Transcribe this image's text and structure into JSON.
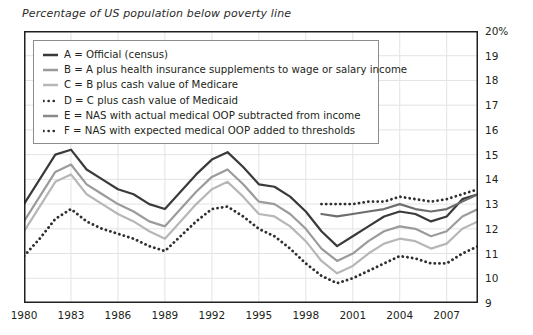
{
  "chart_data": {
    "type": "line",
    "title": "Percentage of US population below poverty line",
    "xlabel": "",
    "ylabel": "",
    "xlim": [
      1980,
      2009
    ],
    "ylim": [
      9,
      20
    ],
    "grid": true,
    "legend_position": "upper-left-inside",
    "y_ticks": [
      "20%",
      "19",
      "18",
      "17",
      "16",
      "15",
      "14",
      "13",
      "12",
      "11",
      "10",
      "9"
    ],
    "y_tick_values": [
      20,
      19,
      18,
      17,
      16,
      15,
      14,
      13,
      12,
      11,
      10,
      9
    ],
    "x_ticks": [
      "1980",
      "1983",
      "1986",
      "1989",
      "1992",
      "1995",
      "1998",
      "2001",
      "2004",
      "2007"
    ],
    "x_tick_values": [
      1980,
      1983,
      1986,
      1989,
      1992,
      1995,
      1998,
      2001,
      2004,
      2007
    ],
    "x": [
      1980,
      1981,
      1982,
      1983,
      1984,
      1985,
      1986,
      1987,
      1988,
      1989,
      1990,
      1991,
      1992,
      1993,
      1994,
      1995,
      1996,
      1997,
      1998,
      1999,
      2000,
      2001,
      2002,
      2003,
      2004,
      2005,
      2006,
      2007,
      2008,
      2009
    ],
    "series": [
      {
        "name": "A",
        "label": "A = Official (census)",
        "style": "solid",
        "color": "#3a3a3a",
        "width": 2.2,
        "values": [
          13.0,
          14.0,
          15.0,
          15.2,
          14.4,
          14.0,
          13.6,
          13.4,
          13.0,
          12.8,
          13.5,
          14.2,
          14.8,
          15.1,
          14.5,
          13.8,
          13.7,
          13.3,
          12.7,
          11.9,
          11.3,
          11.7,
          12.1,
          12.5,
          12.7,
          12.6,
          12.3,
          12.5,
          13.2,
          13.4
        ]
      },
      {
        "name": "B",
        "label": "B = A plus health insurance supplements to wage or salary income",
        "style": "solid",
        "color": "#9b9b9b",
        "width": 2.2,
        "values": [
          12.3,
          13.3,
          14.3,
          14.6,
          13.8,
          13.4,
          13.0,
          12.7,
          12.3,
          12.1,
          12.8,
          13.5,
          14.1,
          14.4,
          13.8,
          13.1,
          13.0,
          12.6,
          12.0,
          11.2,
          10.7,
          11.0,
          11.5,
          11.9,
          12.1,
          12.0,
          11.7,
          11.9,
          12.5,
          12.8
        ]
      },
      {
        "name": "C",
        "label": "C = B plus cash value of Medicare",
        "style": "solid",
        "color": "#b7b7b7",
        "width": 2.2,
        "values": [
          11.9,
          12.9,
          13.9,
          14.2,
          13.4,
          13.0,
          12.6,
          12.3,
          11.9,
          11.6,
          12.3,
          13.0,
          13.6,
          13.9,
          13.3,
          12.6,
          12.5,
          12.1,
          11.5,
          10.7,
          10.2,
          10.5,
          11.0,
          11.4,
          11.6,
          11.5,
          11.2,
          11.4,
          12.0,
          12.3
        ]
      },
      {
        "name": "D",
        "label": "D = C plus cash value of Medicaid",
        "style": "dotted",
        "color": "#2f2f2f",
        "width": 2.4,
        "values": [
          10.9,
          11.6,
          12.4,
          12.8,
          12.3,
          12.0,
          11.8,
          11.6,
          11.3,
          11.1,
          11.7,
          12.3,
          12.8,
          12.9,
          12.5,
          12.0,
          11.7,
          11.2,
          10.6,
          10.1,
          9.8,
          10.0,
          10.3,
          10.6,
          10.9,
          10.8,
          10.6,
          10.6,
          11.0,
          11.3
        ]
      },
      {
        "name": "E",
        "label": "E = NAS with actual medical OOP subtracted from income",
        "style": "solid",
        "color": "#6e6e6e",
        "width": 2.2,
        "values": [
          null,
          null,
          null,
          null,
          null,
          null,
          null,
          null,
          null,
          null,
          null,
          null,
          null,
          null,
          null,
          null,
          null,
          null,
          null,
          12.6,
          12.5,
          12.6,
          12.7,
          12.8,
          13.0,
          12.8,
          12.7,
          12.8,
          13.1,
          13.4
        ]
      },
      {
        "name": "F",
        "label": "F = NAS with expected medical OOP added to thresholds",
        "style": "dotted",
        "color": "#2f2f2f",
        "width": 2.4,
        "values": [
          null,
          null,
          null,
          null,
          null,
          null,
          null,
          null,
          null,
          null,
          null,
          null,
          null,
          null,
          null,
          null,
          null,
          null,
          null,
          13.0,
          13.0,
          13.0,
          13.1,
          13.1,
          13.3,
          13.2,
          13.1,
          13.2,
          13.4,
          13.6
        ]
      }
    ]
  },
  "legend": {
    "items": [
      {
        "label": "A = Official (census)",
        "style": "solid",
        "color": "#3a3a3a"
      },
      {
        "label": "B = A plus health insurance supplements to wage or salary income",
        "style": "solid",
        "color": "#9b9b9b"
      },
      {
        "label": "C = B plus cash value of Medicare",
        "style": "solid",
        "color": "#b7b7b7"
      },
      {
        "label": "D = C plus cash value of Medicaid",
        "style": "dotted",
        "color": "#2f2f2f"
      },
      {
        "label": "E = NAS with actual medical OOP subtracted from income",
        "style": "solid",
        "color": "#8a8a8a"
      },
      {
        "label": "F = NAS with expected medical OOP added to thresholds",
        "style": "dotted",
        "color": "#2f2f2f"
      }
    ]
  },
  "colors": {
    "axis": "#231f20",
    "grid": "#e3e3e6",
    "background": "#ffffff",
    "legend_border": "#8c8c8c"
  }
}
